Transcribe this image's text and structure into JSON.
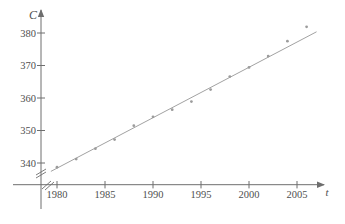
{
  "chart_data": {
    "type": "scatter",
    "title": "",
    "xlabel": "t",
    "ylabel": "C",
    "x_ticks": [
      1980,
      1985,
      1990,
      1995,
      2000,
      2005
    ],
    "y_ticks": [
      340,
      350,
      360,
      370,
      380
    ],
    "xlim": [
      1979,
      2007.5
    ],
    "ylim": [
      335,
      384
    ],
    "grid": false,
    "legend": "none",
    "axis_breaks": {
      "x": true,
      "y": true
    },
    "series": [
      {
        "name": "CO2 concentration data points",
        "marker": "dot",
        "points": [
          {
            "t": 1980,
            "C": 338.7
          },
          {
            "t": 1982,
            "C": 341.2
          },
          {
            "t": 1984,
            "C": 344.4
          },
          {
            "t": 1986,
            "C": 347.2
          },
          {
            "t": 1988,
            "C": 351.5
          },
          {
            "t": 1990,
            "C": 354.2
          },
          {
            "t": 1992,
            "C": 356.4
          },
          {
            "t": 1994,
            "C": 358.9
          },
          {
            "t": 1996,
            "C": 362.6
          },
          {
            "t": 1998,
            "C": 366.6
          },
          {
            "t": 2000,
            "C": 369.4
          },
          {
            "t": 2002,
            "C": 372.9
          },
          {
            "t": 2004,
            "C": 377.5
          },
          {
            "t": 2006,
            "C": 381.9
          }
        ]
      }
    ],
    "trend_line": {
      "name": "linear regression line",
      "slope": 1.552,
      "intercept": -2734.55,
      "t_start": 1979.4,
      "t_end": 2007.0
    },
    "colors": {
      "background": "#ffffff",
      "axis": "#6e6e6e",
      "tick_text": "#4f4f4f",
      "trend_line": "#a2a2a2",
      "point": "#9c9c9c"
    }
  }
}
